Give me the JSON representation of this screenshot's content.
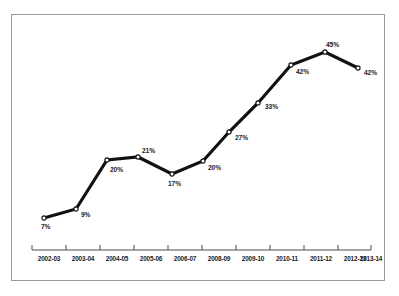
{
  "chart_data": {
    "type": "line",
    "title": "",
    "subtitle": "",
    "xlabel": "",
    "ylabel": "",
    "grid": false,
    "legend": null,
    "marker": "open-circle",
    "line_color": "#111111",
    "categories": [
      "2002-03",
      "2003-04",
      "2004-05",
      "2005-06",
      "2006-07",
      "2008-09",
      "2009-10",
      "2010-11",
      "2011-12",
      "2012-13",
      "2013-14"
    ],
    "values": [
      7,
      9,
      20,
      21,
      17,
      20,
      27,
      33,
      42,
      45,
      42
    ],
    "value_labels": [
      "7%",
      "9%",
      "20%",
      "21%",
      "17%",
      "20%",
      "27%",
      "33%",
      "42%",
      "45%",
      "42%"
    ],
    "ylim": [
      0,
      50
    ],
    "points": [
      {
        "category": "2002-03",
        "value": 7,
        "label": "7%",
        "px": 44,
        "py": 218,
        "lx": 41,
        "ly": 224
      },
      {
        "category": "2003-04",
        "value": 9,
        "label": "9%",
        "px": 76,
        "py": 209,
        "lx": 81,
        "ly": 212
      },
      {
        "category": "2004-05",
        "value": 20,
        "label": "20%",
        "px": 107,
        "py": 160,
        "lx": 110,
        "ly": 167
      },
      {
        "category": "2005-06",
        "value": 21,
        "label": "21%",
        "px": 138,
        "py": 157,
        "lx": 142,
        "ly": 148
      },
      {
        "category": "2006-07",
        "value": 17,
        "label": "17%",
        "px": 172,
        "py": 174,
        "lx": 168,
        "ly": 181
      },
      {
        "category": "2008-09",
        "value": 20,
        "label": "20%",
        "px": 203,
        "py": 161,
        "lx": 208,
        "ly": 165
      },
      {
        "category": "2009-10",
        "value": 27,
        "label": "27%",
        "px": 229,
        "py": 132,
        "lx": 235,
        "ly": 135
      },
      {
        "category": "2010-11",
        "value": 33,
        "label": "33%",
        "px": 258,
        "py": 103,
        "lx": 265,
        "ly": 104
      },
      {
        "category": "2011-12",
        "value": 42,
        "label": "42%",
        "px": 291,
        "py": 65,
        "lx": 296,
        "ly": 69
      },
      {
        "category": "2012-13",
        "value": 45,
        "label": "45%",
        "px": 325,
        "py": 52,
        "lx": 326,
        "ly": 42
      },
      {
        "category": "2013-14",
        "value": 42,
        "label": "42%",
        "px": 358,
        "py": 68,
        "lx": 364,
        "ly": 70
      }
    ],
    "axis": {
      "line_y": 250,
      "line_x_start": 32,
      "line_x_end": 371,
      "tick_height": 5,
      "tick_positions": [
        32,
        66,
        100,
        134,
        168,
        202,
        236,
        270,
        304,
        338,
        371
      ],
      "label_y": 256,
      "label_positions": [
        49,
        83,
        117,
        151,
        185,
        219,
        253,
        287,
        321,
        355,
        371
      ]
    }
  }
}
